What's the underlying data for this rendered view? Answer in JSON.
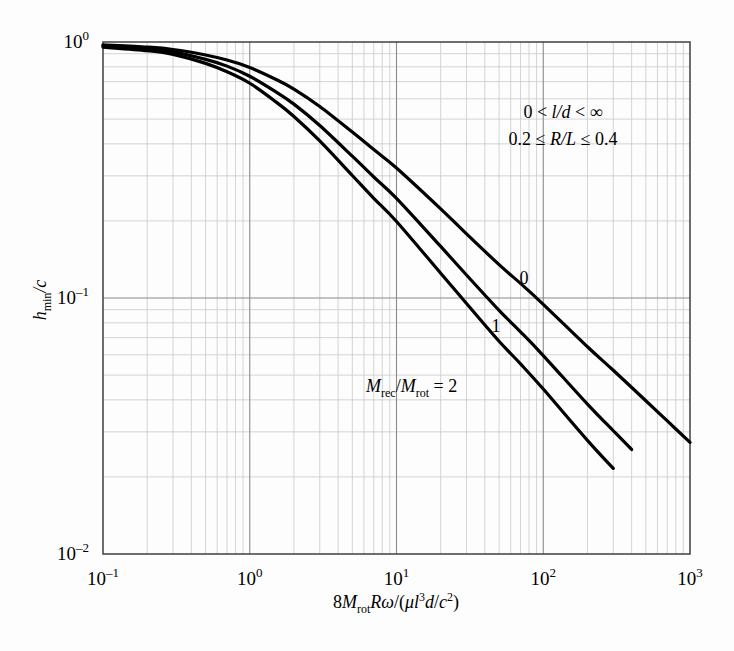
{
  "chart_data": {
    "type": "line",
    "title": "",
    "xlabel": "8M_rot Rω/(μl³d/c²)",
    "ylabel": "h_min/c",
    "xscale": "log",
    "yscale": "log",
    "xlim": [
      0.1,
      1000
    ],
    "ylim": [
      0.01,
      1
    ],
    "grid": "minor-and-major",
    "legend_position": "inline-curve-labels",
    "x_tick_labels": [
      "10⁻¹",
      "10⁰",
      "10¹",
      "10²",
      "10³"
    ],
    "x_tick_values": [
      0.1,
      1,
      10,
      100,
      1000
    ],
    "y_tick_labels": [
      "10⁰",
      "10⁻¹",
      "10⁻²"
    ],
    "y_tick_values": [
      1,
      0.1,
      0.01
    ],
    "series": [
      {
        "name": "0",
        "label": "0",
        "label_x": 130,
        "label_y": 60,
        "x": [
          0.1,
          0.2,
          0.3,
          0.5,
          0.7,
          1.0,
          1.5,
          2.0,
          3.0,
          5.0,
          7.0,
          10,
          20,
          30,
          50,
          70,
          100,
          200,
          300,
          500,
          700,
          1000
        ],
        "y": [
          0.975,
          0.955,
          0.935,
          0.89,
          0.85,
          0.795,
          0.715,
          0.655,
          0.56,
          0.445,
          0.38,
          0.322,
          0.223,
          0.178,
          0.135,
          0.114,
          0.0945,
          0.0645,
          0.0522,
          0.0397,
          0.0331,
          0.0273
        ]
      },
      {
        "name": "1",
        "label": "1",
        "label_x": 161,
        "label_y": 34,
        "x": [
          0.1,
          0.2,
          0.3,
          0.5,
          0.7,
          1.0,
          1.5,
          2.0,
          3.0,
          5.0,
          7.0,
          10,
          20,
          30,
          50,
          70,
          100,
          200,
          300,
          400
        ],
        "y": [
          0.965,
          0.94,
          0.915,
          0.855,
          0.805,
          0.735,
          0.64,
          0.572,
          0.472,
          0.358,
          0.297,
          0.245,
          0.159,
          0.123,
          0.0895,
          0.0738,
          0.0596,
          0.0385,
          0.0303,
          0.0256
        ]
      },
      {
        "name": "2",
        "label": "M_rec/M_rot = 2",
        "label_x": 100,
        "label_y": 18,
        "x": [
          0.1,
          0.2,
          0.3,
          0.5,
          0.7,
          1.0,
          1.5,
          2.0,
          3.0,
          5.0,
          7.0,
          10,
          20,
          30,
          50,
          70,
          100,
          200,
          300
        ],
        "y": [
          0.955,
          0.925,
          0.895,
          0.825,
          0.765,
          0.69,
          0.585,
          0.512,
          0.411,
          0.301,
          0.245,
          0.199,
          0.125,
          0.0952,
          0.0678,
          0.0553,
          0.0441,
          0.0278,
          0.0216
        ]
      }
    ],
    "annotations": [
      {
        "text": "0 < l/d < ∞",
        "x": 560,
        "y": 115
      },
      {
        "text": "0.2 ≤ R/L ≤ 0.4",
        "x": 560,
        "y": 140
      }
    ]
  },
  "axes": {
    "y_label_parts": {
      "main": "h",
      "sub": "min",
      "tail": "/c"
    },
    "x_label_parts": {
      "lead": "8",
      "m": "M",
      "m_sub": "rot",
      "mid": "R",
      "omega": "ω",
      "slash_open": "/(",
      "mu": "μ",
      "l": "l",
      "l_sup": "3",
      "d": "d",
      "slash2": "/",
      "c": "c",
      "c_sup": "2",
      "close": ")"
    }
  },
  "curve_labels": {
    "zero": "0",
    "one": "1",
    "two_prefix_m": "M",
    "two_sub_rec": "rec",
    "two_slash": "/",
    "two_m2": "M",
    "two_sub_rot": "rot",
    "two_eq": " = 2"
  },
  "annotation_lines": {
    "line1_a": "0 < ",
    "line1_ld": "l/d",
    "line1_b": " < ∞",
    "line2_a": "0.2 ≤ ",
    "line2_rl": "R/L",
    "line2_b": " ≤ 0.4"
  },
  "tick_text": {
    "x": [
      {
        "base": "10",
        "exp": "–1"
      },
      {
        "base": "10",
        "exp": "0"
      },
      {
        "base": "10",
        "exp": "1"
      },
      {
        "base": "10",
        "exp": "2"
      },
      {
        "base": "10",
        "exp": "3"
      }
    ],
    "y": [
      {
        "base": "10",
        "exp": "0"
      },
      {
        "base": "10",
        "exp": "–1"
      },
      {
        "base": "10",
        "exp": "–2"
      }
    ]
  }
}
